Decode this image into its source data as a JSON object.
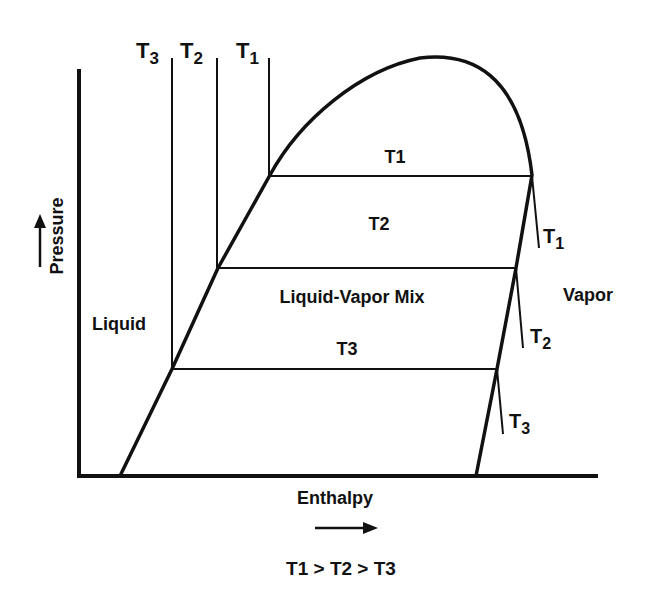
{
  "diagram": {
    "axes": {
      "y_label": "Pressure",
      "x_label": "Enthalpy"
    },
    "regions": {
      "liquid": "Liquid",
      "mix": "Liquid-Vapor Mix",
      "vapor": "Vapor"
    },
    "isotherm_labels_mix": [
      "T1",
      "T2",
      "T3"
    ],
    "liquid_isotherms": [
      {
        "base": "T",
        "sub": "3"
      },
      {
        "base": "T",
        "sub": "2"
      },
      {
        "base": "T",
        "sub": "1"
      }
    ],
    "vapor_isotherms": [
      {
        "base": "T",
        "sub": "1"
      },
      {
        "base": "T",
        "sub": "2"
      },
      {
        "base": "T",
        "sub": "3"
      }
    ],
    "relation": "T1 > T2 > T3",
    "colors": {
      "line": "#111111",
      "background": "#ffffff"
    }
  }
}
